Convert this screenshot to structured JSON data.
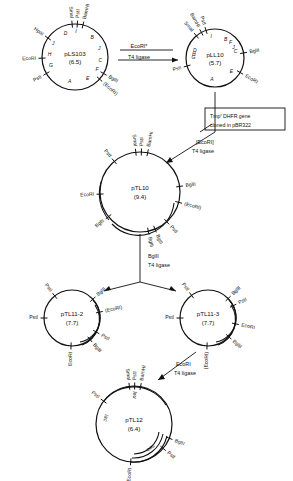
{
  "figure": {
    "background": "#ffffff",
    "ink": "#111111"
  },
  "plasmids": [
    {
      "id": "pLS103",
      "name": "pLS103",
      "size": "(6.5)",
      "cx": 75,
      "cy": 57,
      "r": 33,
      "sites": [
        {
          "label": "HpaI",
          "angle": 145
        },
        {
          "label": "EcoRI",
          "angle": 182
        },
        {
          "label": "PstI",
          "angle": 210
        },
        {
          "label": "SmaI",
          "angle": 95
        },
        {
          "label": "PstI",
          "angle": 86
        },
        {
          "label": "BamHI",
          "angle": 76
        },
        {
          "label": "BglII",
          "angle": 330
        },
        {
          "label": "(EcoRI)",
          "angle": 318
        }
      ],
      "segments": [
        {
          "label": "D",
          "angle": 112
        },
        {
          "label": "I",
          "angle": 88
        },
        {
          "label": "J",
          "angle": 148
        },
        {
          "label": "B",
          "angle": 48
        },
        {
          "label": "H",
          "angle": 175
        },
        {
          "label": "G",
          "angle": 200
        },
        {
          "label": "A",
          "angle": 258
        },
        {
          "label": "J",
          "angle": 18
        },
        {
          "label": "C",
          "angle": 352
        },
        {
          "label": "E",
          "angle": 300
        },
        {
          "label": "F",
          "angle": 330
        }
      ]
    },
    {
      "id": "pLL10",
      "name": "pLL10",
      "size": "(5.7)",
      "cx": 215,
      "cy": 58,
      "r": 29,
      "sites": [
        {
          "label": "BamHI",
          "angle": 118
        },
        {
          "label": "PstI",
          "angle": 108
        },
        {
          "label": "SmaI",
          "angle": 130
        },
        {
          "label": "PstI",
          "angle": 196
        },
        {
          "label": "BglII",
          "angle": 10
        },
        {
          "label": "EcoRI",
          "angle": 330
        }
      ],
      "segments": [
        {
          "label": "B",
          "angle": 60
        },
        {
          "label": "I",
          "angle": 100
        },
        {
          "label": "D",
          "angle": 160
        },
        {
          "label": "G",
          "angle": 178
        },
        {
          "label": "H",
          "angle": 172
        },
        {
          "label": "A",
          "angle": 262
        },
        {
          "label": "J",
          "angle": 30
        },
        {
          "label": "C",
          "angle": 18
        },
        {
          "label": "F",
          "angle": 44
        },
        {
          "label": "E",
          "angle": 320
        }
      ]
    },
    {
      "id": "pTL10",
      "name": "pTL10",
      "size": "(9.4)",
      "cx": 140,
      "cy": 192,
      "r": 40,
      "sites": [
        {
          "label": "PstI",
          "angle": 130
        },
        {
          "label": "SmaI",
          "angle": 96
        },
        {
          "label": "PstI",
          "angle": 88
        },
        {
          "label": "BamHI",
          "angle": 79
        },
        {
          "label": "BglII",
          "angle": 8
        },
        {
          "label": "(EcoRI)",
          "angle": 345
        },
        {
          "label": "EcoRI",
          "angle": 183
        },
        {
          "label": "BglII",
          "angle": 218
        },
        {
          "label": "BglII",
          "angle": 282
        },
        {
          "label": "BglII",
          "angle": 292
        },
        {
          "label": "PstI",
          "angle": 312
        }
      ],
      "segments": []
    },
    {
      "id": "pTL11-2",
      "name": "pTL11-2",
      "size": "(7.7)",
      "cx": 72,
      "cy": 318,
      "r": 28,
      "sites": [
        {
          "label": "PstI",
          "angle": 128
        },
        {
          "label": "PstI",
          "angle": 180
        },
        {
          "label": "BglII",
          "angle": 42
        },
        {
          "label": "(EcoRI)",
          "angle": 12
        },
        {
          "label": "PstI",
          "angle": 330
        },
        {
          "label": "BglII",
          "angle": 310
        },
        {
          "label": "EcoRI",
          "angle": 268
        }
      ],
      "segments": []
    },
    {
      "id": "pTL11-3",
      "name": "pTL11-3",
      "size": "(7.7)",
      "cx": 208,
      "cy": 318,
      "r": 28,
      "sites": [
        {
          "label": "PstI",
          "angle": 126
        },
        {
          "label": "PstI",
          "angle": 180
        },
        {
          "label": "BglII",
          "angle": 44
        },
        {
          "label": "PstI",
          "angle": 26
        },
        {
          "label": "EcoRI",
          "angle": 348
        },
        {
          "label": "BglII",
          "angle": 318
        },
        {
          "label": "(EcoRI)",
          "angle": 268
        }
      ],
      "segments": []
    },
    {
      "id": "pTL12",
      "name": "pTL12",
      "size": "(6.4)",
      "cx": 134,
      "cy": 424,
      "r": 38,
      "sites": [
        {
          "label": "PstI",
          "angle": 143
        },
        {
          "label": "SmaI",
          "angle": 97
        },
        {
          "label": "PstI",
          "angle": 89
        },
        {
          "label": "BamHI",
          "angle": 80
        },
        {
          "label": "BglII",
          "angle": 338
        },
        {
          "label": "PstI",
          "angle": 320
        },
        {
          "label": "EcoRI",
          "angle": 265
        }
      ],
      "genes": [
        {
          "label": "leu",
          "angle": 90
        },
        {
          "label": "lac",
          "angle": 168
        },
        {
          "label": "neo",
          "angle": 305
        }
      ],
      "segments": []
    }
  ],
  "steps": [
    {
      "id": "step-1",
      "enzyme": "EcoRI*",
      "ligase": "T4 ligase",
      "x": 139,
      "y": 52
    },
    {
      "id": "step-2",
      "enzyme": "[EcoRI]",
      "ligase": "T4 ligase",
      "x": 196,
      "y": 144
    },
    {
      "id": "step-3",
      "enzyme": "BglII",
      "ligase": "T4 ligase",
      "x": 140,
      "y": 258
    },
    {
      "id": "step-4",
      "enzyme": "EcoRI",
      "ligase": "T4 ligase",
      "x": 176,
      "y": 366
    }
  ],
  "notes": [
    {
      "id": "tmp-dhfr-note",
      "line1_pre": "Tmp",
      "line1_sup": "r",
      "line1_post": " DHFR gene",
      "line2": "cloned in pBR322",
      "x": 205,
      "y": 108,
      "w": 80,
      "h": 22
    }
  ]
}
